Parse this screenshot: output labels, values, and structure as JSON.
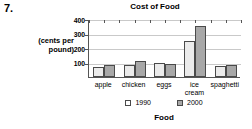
{
  "question": {
    "number": "7."
  },
  "chart_data": {
    "type": "bar",
    "title": "Cost of Food",
    "xlabel": "Food",
    "ylabel": "(cents per pound)",
    "ylabel_line1": "(cents per",
    "ylabel_line2": "pound)",
    "categories": [
      "apple",
      "chicken",
      "eggs",
      "ice cream",
      "spaghetti"
    ],
    "category_labels": [
      {
        "line1": "apple",
        "line2": ""
      },
      {
        "line1": "chicken",
        "line2": ""
      },
      {
        "line1": "eggs",
        "line2": ""
      },
      {
        "line1": "ice",
        "line2": "cream"
      },
      {
        "line1": "spaghetti",
        "line2": ""
      }
    ],
    "series": [
      {
        "name": "1990",
        "color": "#ebebeb",
        "values": [
          70,
          85,
          95,
          245,
          75
        ]
      },
      {
        "name": "2000",
        "color": "#a8a8a8",
        "values": [
          80,
          110,
          90,
          355,
          82
        ]
      }
    ],
    "yticks": [
      100,
      200,
      300,
      400
    ],
    "ytick_labels": [
      "100",
      "200",
      "300",
      "400"
    ],
    "ylim": [
      0,
      400
    ],
    "grid": true,
    "legend_position": "bottom"
  }
}
